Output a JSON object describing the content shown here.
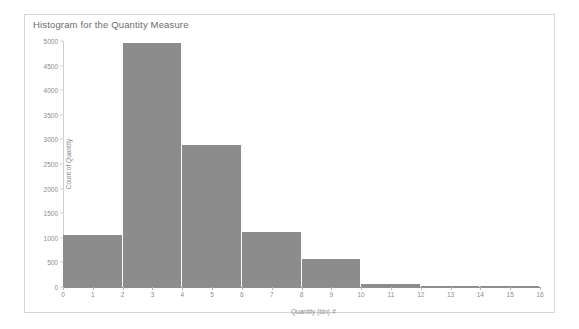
{
  "frame": {
    "border_color": "#d6d6d6",
    "background": "#ffffff"
  },
  "chart_data": {
    "type": "bar",
    "title": "Histogram for the Quantity Measure",
    "xlabel": "Quantity (bin)",
    "xlabel_icon": "#",
    "ylabel": "Count of Quantity",
    "bar_color": "#8c8c8c",
    "grid": false,
    "legend": "none",
    "bin_width": 2,
    "xlim": [
      0,
      16
    ],
    "ylim": [
      0,
      5000
    ],
    "xticks": [
      0,
      1,
      2,
      3,
      4,
      5,
      6,
      7,
      8,
      9,
      10,
      11,
      12,
      13,
      14,
      15,
      16
    ],
    "xtick_labels": [
      "0",
      "1",
      "2",
      "3",
      "4",
      "5",
      "6",
      "7",
      "8",
      "9",
      "10",
      "11",
      "12",
      "13",
      "14",
      "15",
      "16"
    ],
    "yticks": [
      0,
      500,
      1000,
      1500,
      2000,
      2500,
      3000,
      3500,
      4000,
      4500,
      5000
    ],
    "ytick_labels": [
      "0",
      "500",
      "1000",
      "1500",
      "2000",
      "2500",
      "3000",
      "3500",
      "4000",
      "4500",
      "5000"
    ],
    "bins": [
      {
        "x0": 0,
        "x1": 2,
        "label": "0",
        "value": 1050
      },
      {
        "x0": 2,
        "x1": 4,
        "label": "2",
        "value": 4960
      },
      {
        "x0": 4,
        "x1": 6,
        "label": "4",
        "value": 2880
      },
      {
        "x0": 6,
        "x1": 8,
        "label": "6",
        "value": 1120
      },
      {
        "x0": 8,
        "x1": 10,
        "label": "8",
        "value": 560
      },
      {
        "x0": 10,
        "x1": 12,
        "label": "10",
        "value": 60
      },
      {
        "x0": 12,
        "x1": 14,
        "label": "12",
        "value": 22
      },
      {
        "x0": 14,
        "x1": 16,
        "label": "14",
        "value": 8
      }
    ],
    "categories": [
      "0",
      "2",
      "4",
      "6",
      "8",
      "10",
      "12",
      "14"
    ],
    "values": [
      1050,
      4960,
      2880,
      1120,
      560,
      60,
      22,
      8
    ]
  }
}
